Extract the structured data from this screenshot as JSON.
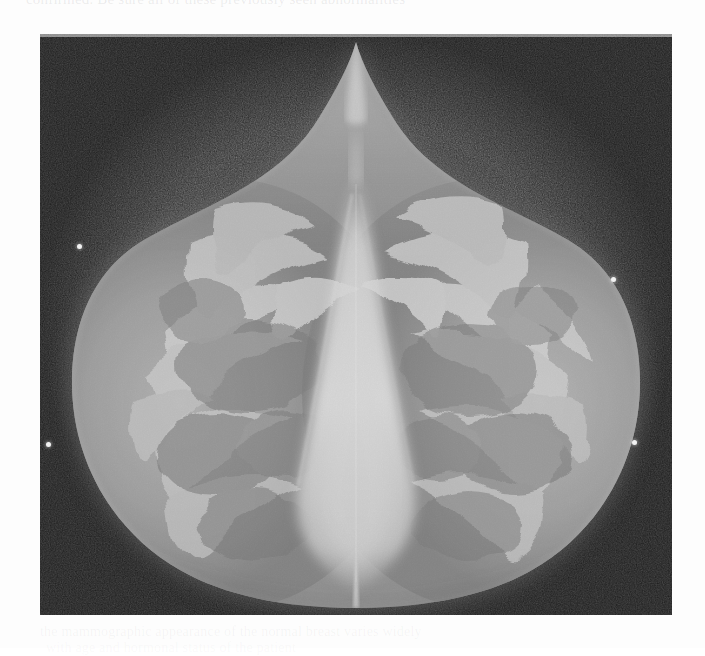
{
  "page": {
    "background_color": "#fdfdfd",
    "top_cutoff_text": "confirmed. Be sure all of these previously seen abnormalities",
    "bottom_bleedthrough_line_1": "the mammographic appearance of the normal breast varies widely",
    "bottom_bleedthrough_line_2": "with age and hormonal status of the patient"
  },
  "figure": {
    "name": "bilateral-mammogram",
    "modality": "mammography",
    "view": "craniocaudal-bilateral",
    "frame": {
      "x": 40,
      "y": 34,
      "width": 632,
      "height": 581
    },
    "background_color": "#2f2f2f",
    "tissue_color": "#9a9a9a",
    "dense_tissue_color": "#d8d8d8",
    "skin_line_color": "#6e6e6e",
    "marker_color": "#f2f2f2",
    "markers": [
      {
        "label": "skin-marker-upper-left",
        "x": 78,
        "y": 245
      },
      {
        "label": "skin-marker-upper-right",
        "x": 611,
        "y": 278
      },
      {
        "label": "skin-marker-lower-left",
        "x": 47,
        "y": 443
      },
      {
        "label": "skin-marker-lower-right",
        "x": 632,
        "y": 441
      }
    ]
  }
}
